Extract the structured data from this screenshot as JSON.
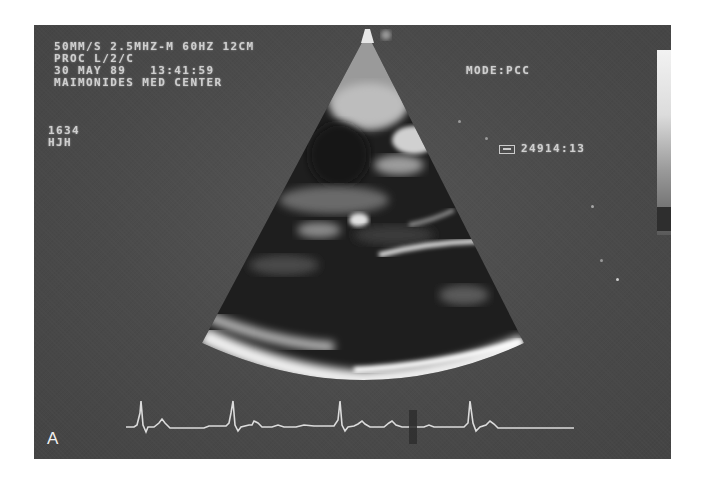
{
  "figure": {
    "panel_label": "A",
    "overlay": {
      "line1": "50MM/S 2.5MHZ-M 60HZ 12CM",
      "line2": "PROC L/2/C",
      "line3": "30 MAY 89   13:41:59",
      "line4": "MAIMONIDES MED CENTER",
      "id_line1": "1634",
      "id_line2": "HJH",
      "mode": "MODE:PCC",
      "frame_icon": "tape-box-icon",
      "frame_counter": "24914:13"
    },
    "colors": {
      "background": "#4a4a4a",
      "overlay_text": "#e2e2e2",
      "ecg_trace": "#dcdcdc"
    }
  }
}
